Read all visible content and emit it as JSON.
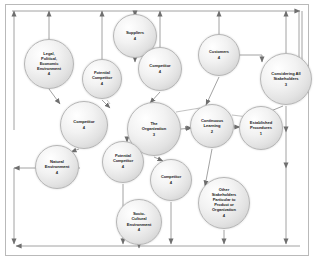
{
  "diagram": {
    "frame": {
      "border_color": "#b9b9b9"
    },
    "style": {
      "node_fill": "#e6e6e6",
      "node_stroke": "#b5b5b5",
      "wire_color": "#808080",
      "text_color": "#1b1b1b"
    },
    "nodes": [
      {
        "id": "legal",
        "label": "Legal,\nPolitical,\nEconomic\nEnvironment",
        "number": "4",
        "cx": 49,
        "cy": 64,
        "r": 25
      },
      {
        "id": "suppliers",
        "label": "Suppliers",
        "number": "4",
        "cx": 135,
        "cy": 36,
        "r": 22
      },
      {
        "id": "potential1",
        "label": "Potential\nCompetitor",
        "number": "4",
        "cx": 102,
        "cy": 79,
        "r": 20
      },
      {
        "id": "competitor1",
        "label": "Competitor",
        "number": "4",
        "cx": 160,
        "cy": 69,
        "r": 22
      },
      {
        "id": "customers",
        "label": "Customers",
        "number": "4",
        "cx": 219,
        "cy": 55,
        "r": 21
      },
      {
        "id": "stakeall",
        "label": "Considering All\nStakeholders",
        "number": "3",
        "cx": 286,
        "cy": 79,
        "r": 26
      },
      {
        "id": "competitor2",
        "label": "Competitor",
        "number": "4",
        "cx": 84,
        "cy": 125,
        "r": 24
      },
      {
        "id": "organization",
        "label": "The\nOrganization",
        "number": "3",
        "cx": 154,
        "cy": 129,
        "r": 27
      },
      {
        "id": "continuous",
        "label": "Continuous\nLearning",
        "number": "2",
        "cx": 212,
        "cy": 126,
        "r": 22
      },
      {
        "id": "established",
        "label": "Established\nProcedures",
        "number": "1",
        "cx": 261,
        "cy": 128,
        "r": 22
      },
      {
        "id": "natural",
        "label": "Natural\nEnvironment",
        "number": "4",
        "cx": 57,
        "cy": 167,
        "r": 22
      },
      {
        "id": "potential2",
        "label": "Potential\nCompetitor",
        "number": "4",
        "cx": 123,
        "cy": 162,
        "r": 21
      },
      {
        "id": "competitor3",
        "label": "Competitor",
        "number": "4",
        "cx": 171,
        "cy": 180,
        "r": 21
      },
      {
        "id": "otherstake",
        "label": "Other\nStakeholders\nParticular to\nProduct or\nOrganization",
        "number": "4",
        "cx": 224,
        "cy": 203,
        "r": 26
      },
      {
        "id": "socio",
        "label": "Socio-\nCultural\nEnvironment",
        "number": "4",
        "cx": 139,
        "cy": 222,
        "r": 23
      }
    ],
    "connector_count": 28,
    "arrow_glyph": "triangle-arrowhead"
  }
}
